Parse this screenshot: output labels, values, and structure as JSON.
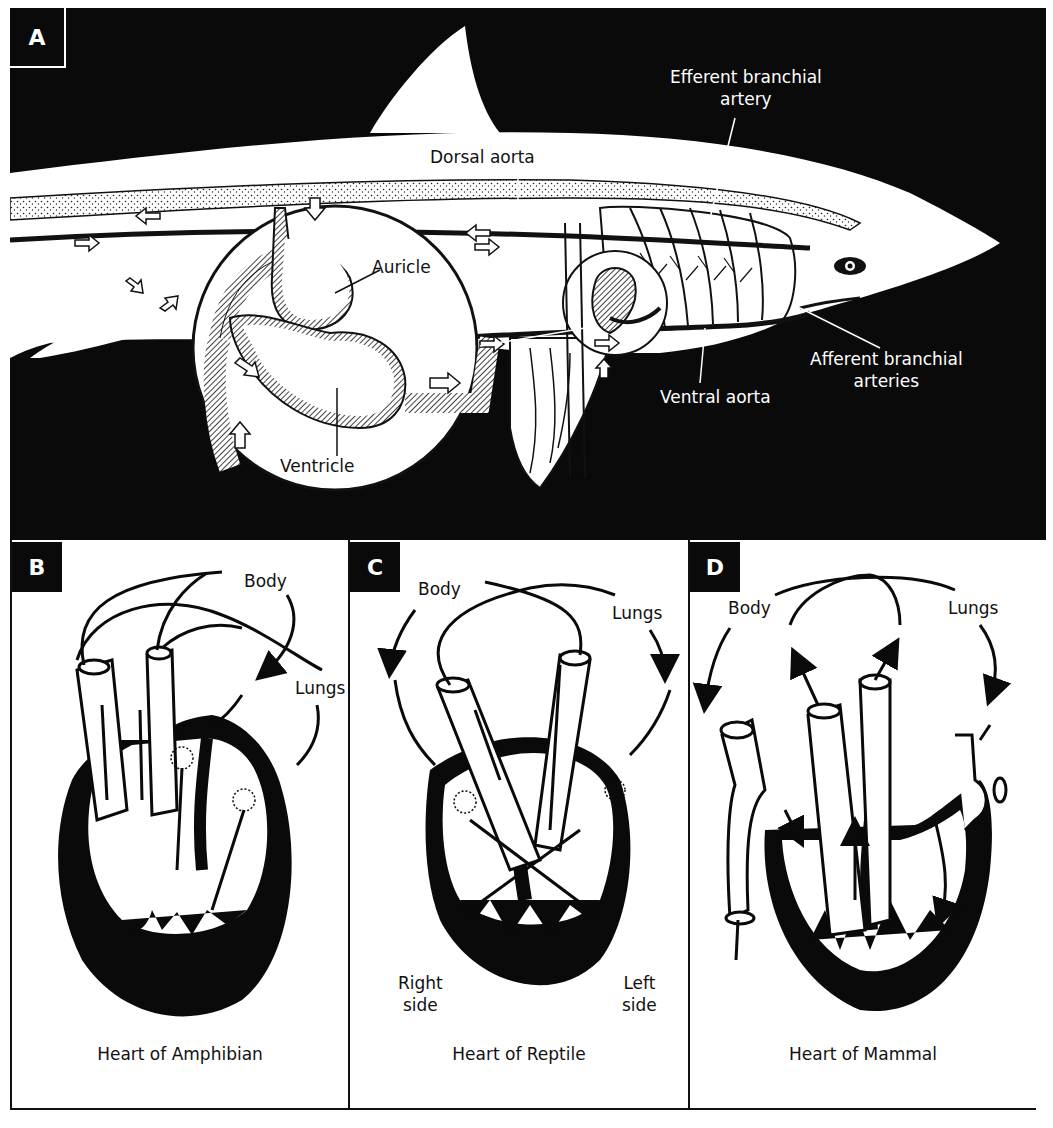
{
  "figure": {
    "background": "#ffffff",
    "ink": "#0a0a0a"
  },
  "panel_a": {
    "letter": "A",
    "subject": "shark circulatory system",
    "labels": {
      "efferent_line1": "Efferent branchial",
      "efferent_line2": "artery",
      "dorsal_aorta": "Dorsal aorta",
      "auricle": "Auricle",
      "ventricle": "Ventricle",
      "ventral_aorta": "Ventral aorta",
      "afferent_line1": "Afferent branchial",
      "afferent_line2": "arteries"
    }
  },
  "panel_b": {
    "letter": "B",
    "labels": {
      "body": "Body",
      "lungs": "Lungs"
    },
    "caption": "Heart of Amphibian"
  },
  "panel_c": {
    "letter": "C",
    "labels": {
      "body": "Body",
      "lungs": "Lungs",
      "right_line1": "Right",
      "right_line2": "side",
      "left_line1": "Left",
      "left_line2": "side"
    },
    "caption": "Heart of Reptile"
  },
  "panel_d": {
    "letter": "D",
    "labels": {
      "body": "Body",
      "lungs": "Lungs"
    },
    "caption": "Heart of Mammal"
  }
}
